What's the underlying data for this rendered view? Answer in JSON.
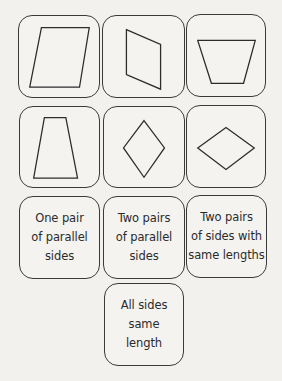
{
  "shapes": [
    {
      "name": "parallelogram",
      "row": 1,
      "col": 1
    },
    {
      "name": "parallelogram-vertical",
      "row": 1,
      "col": 2
    },
    {
      "name": "trapezoid-inverted",
      "row": 1,
      "col": 3
    },
    {
      "name": "trapezoid",
      "row": 2,
      "col": 1
    },
    {
      "name": "rhombus-tall",
      "row": 2,
      "col": 2
    },
    {
      "name": "rhombus-wide",
      "row": 2,
      "col": 3
    }
  ],
  "labels": [
    {
      "lines": [
        "One pair",
        "of parallel",
        "sides"
      ]
    },
    {
      "lines": [
        "Two pairs",
        "of parallel",
        "sides"
      ]
    },
    {
      "lines": [
        "Two pairs",
        "of sides with",
        "same lengths"
      ]
    },
    {
      "lines": [
        "All sides",
        "same",
        "length"
      ]
    }
  ],
  "colors": {
    "background": "#f2f1ee",
    "stroke": "#2c2c2c",
    "text": "#2b2b2b"
  }
}
